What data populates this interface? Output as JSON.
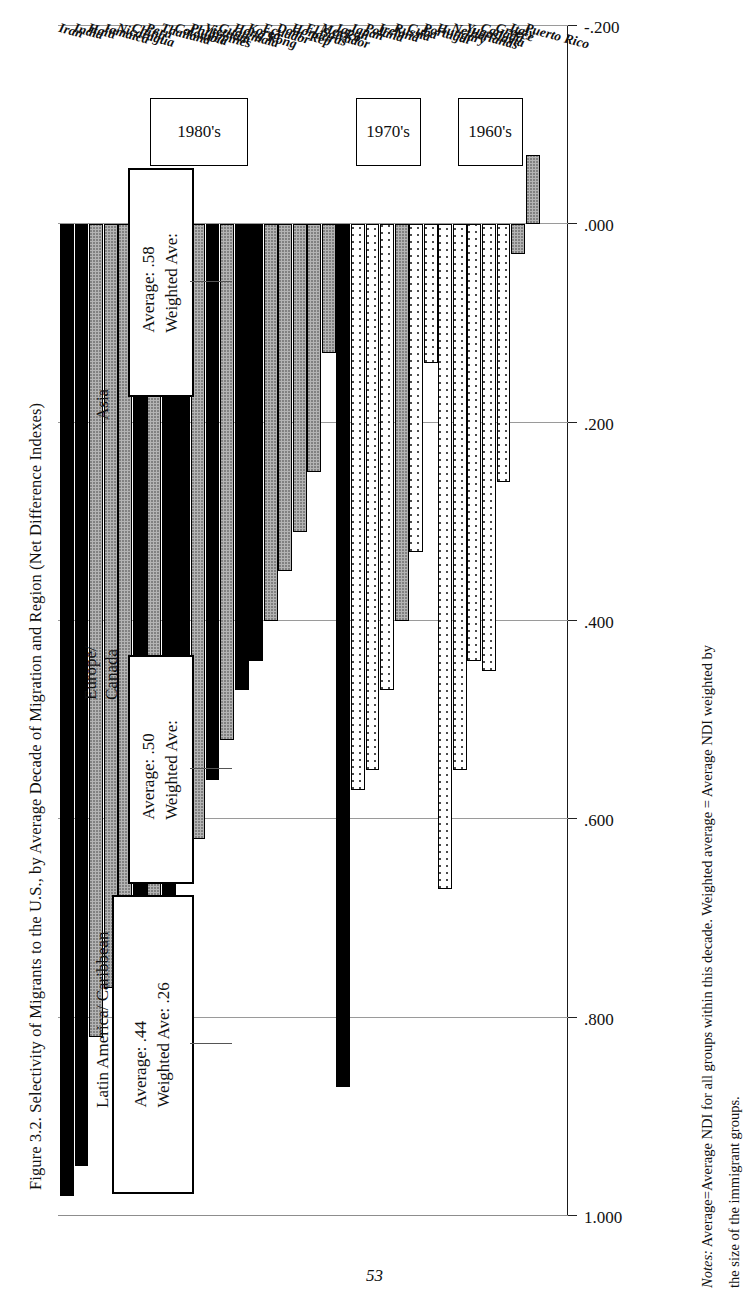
{
  "figure": {
    "caption": "Figure 3.2. Selectivity of Migrants to the U.S., by Average Decade of Migration and Region (Net Difference Indexes)",
    "page_number": "53",
    "notes_label": "Notes:",
    "notes_line1": "Average=Average NDI for all groups within this decade.  Weighted average = Average NDI weighted by",
    "notes_line2": "the size of the immigrant groups."
  },
  "legend": {
    "position": "top-left",
    "items": [
      {
        "label": "Latin America/ Caribbean",
        "swatch": "latin",
        "color": "#b4b4b4"
      },
      {
        "label": "Europe/\nCanada",
        "swatch": "europe",
        "color": "#ffffff"
      },
      {
        "label": "Asia",
        "swatch": "asia",
        "color": "#000000"
      }
    ]
  },
  "annotations": {
    "decades": [
      {
        "id": "1960s",
        "label": "1960's"
      },
      {
        "id": "1970s",
        "label": "1970's"
      },
      {
        "id": "1980s",
        "label": "1980's"
      }
    ],
    "averages": [
      {
        "decade": "1960's",
        "average_label": "Average: .44",
        "weighted_label": "Weighted Ave: .26",
        "average": 0.44,
        "weighted_average": 0.26
      },
      {
        "decade": "1970's",
        "average_label": "Average: .50",
        "weighted_label": "Weighted Ave:",
        "average": 0.5,
        "weighted_average": null
      },
      {
        "decade": "1980's",
        "average_label": "Average: .58",
        "weighted_label": "Weighted Ave:",
        "average": 0.58,
        "weighted_average": null
      }
    ]
  },
  "chart_data": {
    "type": "bar",
    "orientation": "horizontal",
    "title": "Figure 3.2. Selectivity of Migrants to the U.S., by Average Decade of Migration and Region (Net Difference Indexes)",
    "xlabel": "",
    "ylabel": "Net Difference Index",
    "ylim": [
      -0.2,
      1.0
    ],
    "grid": true,
    "tick_labels": [
      "1.000",
      ".800",
      ".600",
      ".400",
      ".200",
      ".000",
      "-.200"
    ],
    "tick_values": [
      1.0,
      0.8,
      0.6,
      0.4,
      0.2,
      0.0,
      -0.2
    ],
    "legend_position": "top-left",
    "series": [
      {
        "name": "Latin America/ Caribbean",
        "color": "#b4b4b4",
        "fill": "latin"
      },
      {
        "name": "Europe/ Canada",
        "color": "#ffffff",
        "fill": "europe"
      },
      {
        "name": "Asia",
        "color": "#000000",
        "fill": "asia"
      }
    ],
    "groups": [
      {
        "decade": "1960's",
        "bars": [
          {
            "country": "Puerto Rico",
            "value": -0.07,
            "region": "latin"
          },
          {
            "country": "Italy",
            "value": 0.03,
            "region": "latin"
          },
          {
            "country": "Greece",
            "value": 0.26,
            "region": "europe"
          },
          {
            "country": "Canada",
            "value": 0.45,
            "region": "europe"
          },
          {
            "country": "Yugoslavia",
            "value": 0.44,
            "region": "europe"
          },
          {
            "country": "Netherlands",
            "value": 0.55,
            "region": "europe"
          },
          {
            "country": "Hungary",
            "value": 0.67,
            "region": "europe"
          }
        ]
      },
      {
        "decade": "1970's",
        "bars": [
          {
            "country": "Portugal",
            "value": 0.14,
            "region": "europe"
          },
          {
            "country": "Cuba",
            "value": 0.33,
            "region": "europe"
          },
          {
            "country": "Russia",
            "value": 0.4,
            "region": "latin"
          },
          {
            "country": "Ireland",
            "value": 0.47,
            "region": "europe"
          },
          {
            "country": "Poland",
            "value": 0.55,
            "region": "europe"
          },
          {
            "country": "Japan",
            "value": 0.57,
            "region": "europe"
          },
          {
            "country": "Japan",
            "value": 0.87,
            "region": "asia"
          }
        ]
      },
      {
        "decade": "1980's",
        "bars": [
          {
            "country": "Mexico",
            "value": 0.13,
            "region": "latin"
          },
          {
            "country": "El Salvador",
            "value": 0.25,
            "region": "latin"
          },
          {
            "country": "Honduras",
            "value": 0.31,
            "region": "latin"
          },
          {
            "country": "Dom. Rep",
            "value": 0.35,
            "region": "latin"
          },
          {
            "country": "Ecuador",
            "value": 0.4,
            "region": "latin"
          },
          {
            "country": "Korea",
            "value": 0.44,
            "region": "asia"
          },
          {
            "country": "Hong Kong",
            "value": 0.47,
            "region": "asia"
          },
          {
            "country": "Guatemala",
            "value": 0.52,
            "region": "latin"
          },
          {
            "country": "Vietnam",
            "value": 0.56,
            "region": "asia"
          },
          {
            "country": "Philippines",
            "value": 0.62,
            "region": "latin"
          },
          {
            "country": "Colombia",
            "value": 0.64,
            "region": "asia"
          },
          {
            "country": "Thailand",
            "value": 0.68,
            "region": "asia"
          },
          {
            "country": "Peru",
            "value": 0.72,
            "region": "latin"
          },
          {
            "country": "China",
            "value": 0.74,
            "region": "asia"
          },
          {
            "country": "Nicaragua",
            "value": 0.76,
            "region": "latin"
          },
          {
            "country": "Jamaica",
            "value": 0.77,
            "region": "latin"
          },
          {
            "country": "Haiti",
            "value": 0.82,
            "region": "latin"
          },
          {
            "country": "India",
            "value": 0.95,
            "region": "asia"
          },
          {
            "country": "Iran",
            "value": 0.98,
            "region": "asia"
          }
        ]
      }
    ]
  }
}
